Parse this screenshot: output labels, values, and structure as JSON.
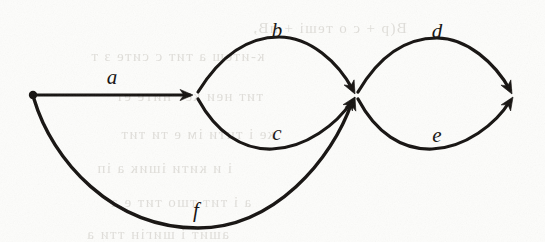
{
  "figure": {
    "kind": "directed-graph",
    "title": "",
    "background_color": "#fdfdfb",
    "ink_color": "#14110f",
    "width": 545,
    "height": 242
  },
  "nodes": [
    {
      "id": "n0",
      "name": "start-node",
      "x": 33,
      "y": 95,
      "shape": "dot",
      "radius": 4.2
    },
    {
      "id": "n1",
      "name": "node-1",
      "x": 196,
      "y": 95,
      "shape": "arrow-tip",
      "radius": 0
    },
    {
      "id": "n2",
      "name": "node-2",
      "x": 356,
      "y": 96,
      "shape": "arrow-tip",
      "radius": 0
    },
    {
      "id": "n3",
      "name": "end-node",
      "x": 513,
      "y": 95,
      "shape": "arrow-tip",
      "radius": 0
    }
  ],
  "edges": [
    {
      "id": "e-a",
      "name": "edge-a",
      "label": "a",
      "from": "n0",
      "to": "n1",
      "label_x": 112,
      "label_y": 77,
      "path": "M 33 95 L 190 95",
      "stroke_width": 3.0,
      "arrow_at": {
        "x": 193,
        "y": 95,
        "angle": 0
      }
    },
    {
      "id": "e-b",
      "name": "edge-b",
      "label": "b",
      "from": "n1",
      "to": "n2",
      "label_x": 277,
      "label_y": 30,
      "path": "M 198 92 C 224 50 252 37 279 37 C 310 37 338 62 353 90",
      "stroke_width": 3.2,
      "arrow_at": {
        "x": 355,
        "y": 94,
        "angle": 63
      }
    },
    {
      "id": "e-c",
      "name": "edge-c",
      "label": "c",
      "from": "n1",
      "to": "n2",
      "label_x": 277,
      "label_y": 133,
      "path": "M 198 99 C 216 132 242 150 272 149 C 306 148 337 124 352 101",
      "stroke_width": 3.2,
      "arrow_at": {
        "x": 355,
        "y": 97,
        "angle": -56
      }
    },
    {
      "id": "e-d",
      "name": "edge-d",
      "label": "d",
      "from": "n2",
      "to": "n3",
      "label_x": 437,
      "label_y": 31,
      "path": "M 358 92 C 382 51 410 38 437 38 C 467 38 495 63 510 90",
      "stroke_width": 3.2,
      "arrow_at": {
        "x": 512,
        "y": 94,
        "angle": 62
      }
    },
    {
      "id": "e-e",
      "name": "edge-e",
      "label": "e",
      "from": "n2",
      "to": "n3",
      "label_x": 437,
      "label_y": 135,
      "path": "M 358 99 C 376 133 402 150 432 149 C 465 148 496 124 510 101",
      "stroke_width": 3.2,
      "arrow_at": {
        "x": 513,
        "y": 97,
        "angle": -57
      }
    },
    {
      "id": "e-f",
      "name": "edge-f",
      "label": "f",
      "from": "n0",
      "to": "n2",
      "label_x": 196,
      "label_y": 210,
      "path": "M 34 99 C 52 160 112 228 198 228 C 274 228 332 160 352 102",
      "stroke_width": 3.4,
      "arrow_at": {
        "x": 355,
        "y": 97,
        "angle": -70
      }
    }
  ],
  "labels": [
    {
      "name": "edge-label-a",
      "text": "a"
    },
    {
      "name": "edge-label-b",
      "text": "b"
    },
    {
      "name": "edge-label-c",
      "text": "c"
    },
    {
      "name": "edge-label-d",
      "text": "d"
    },
    {
      "name": "edge-label-e",
      "text": "e"
    },
    {
      "name": "edge-label-f",
      "text": "f"
    }
  ],
  "background_ghost_text": [
    {
      "text": "Β(р + с ο теші + пВ,",
      "x": 252,
      "y": 20,
      "size": 15
    },
    {
      "text": "к-итеш а тит с сите з т",
      "x": 90,
      "y": 48,
      "size": 15
    },
    {
      "text": "тит неи кет ните ет",
      "x": 115,
      "y": 88,
      "size": 15
    },
    {
      "text": "ке і тити ім е ти тит",
      "x": 120,
      "y": 126,
      "size": 15
    },
    {
      "text": "і и кити ішик а іп",
      "x": 96,
      "y": 160,
      "size": 15
    },
    {
      "text": "а і тит тшо тит е а",
      "x": 110,
      "y": 194,
      "size": 15
    },
    {
      "text": "ашит і шигін тти а",
      "x": 86,
      "y": 226,
      "size": 15
    }
  ]
}
